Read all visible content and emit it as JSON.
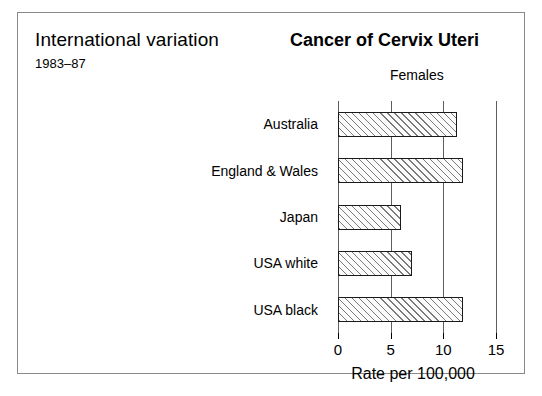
{
  "figure": {
    "title_left": "International variation",
    "subtitle_left": "1983–87",
    "title_right": "Cancer of Cervix Uteri",
    "sex_label": "Females",
    "border_color": "#8a8a8a"
  },
  "chart_data": {
    "type": "bar",
    "orientation": "horizontal",
    "title": "Cancer of Cervix Uteri",
    "subtitle": "Females",
    "xlabel": "Rate per 100,000",
    "ylabel": "",
    "categories": [
      "Australia",
      "England & Wales",
      "Japan",
      "USA white",
      "USA black"
    ],
    "values": [
      11.3,
      11.9,
      6.0,
      7.0,
      11.9
    ],
    "xlim": [
      0,
      15
    ],
    "xticks": [
      0,
      5,
      10,
      15
    ],
    "xtick_labels": [
      "0",
      "5",
      "10",
      "15"
    ],
    "grid": true,
    "grid_axis": "x",
    "legend": false,
    "bar_fill": "hatched-diagonal",
    "bar_edge_color": "#1a1a1a",
    "period": "1983–87"
  }
}
